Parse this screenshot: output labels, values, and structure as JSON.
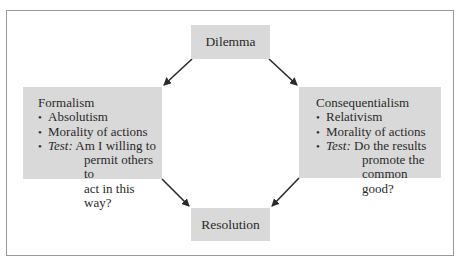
{
  "diagram": {
    "top": {
      "label": "Dilemma"
    },
    "bottom": {
      "label": "Resolution"
    },
    "left": {
      "title": "Formalism",
      "bullets": [
        "Absolutism",
        "Morality of actions"
      ],
      "test_label": "Test:",
      "test_lines": [
        "Am I willing to",
        "permit others to",
        "act in this way?"
      ]
    },
    "right": {
      "title": "Consequentialism",
      "bullets": [
        "Relativism",
        "Morality of actions"
      ],
      "test_label": "Test:",
      "test_lines": [
        "Do the results",
        "promote the",
        "common good?"
      ]
    },
    "colors": {
      "box_fill": "#d9d9d9",
      "frame": "#9a9a9a",
      "arrow": "#2a2a2a"
    }
  }
}
